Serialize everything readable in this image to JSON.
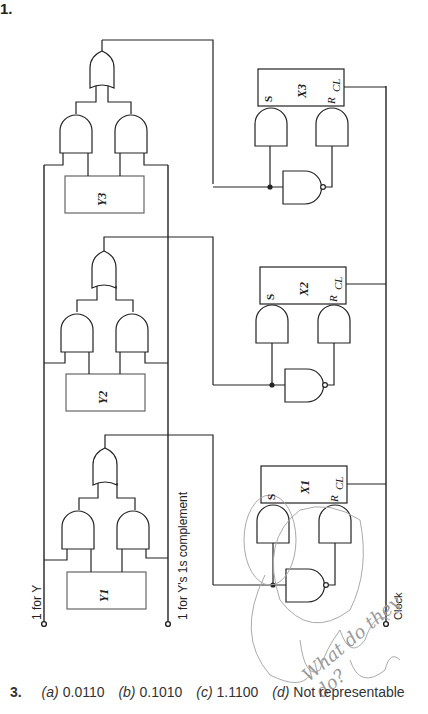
{
  "page": {
    "problem_number": "1.",
    "labels": {
      "input_y": "1 for Y",
      "input_y_complement": "1 for Y's 1s complement",
      "clock": "Clock"
    },
    "registers_y": [
      "Y3",
      "Y2",
      "Y1"
    ],
    "registers_x": [
      {
        "name": "X3",
        "pin_s": "S",
        "pin_r": "R",
        "pin_cl": "CL"
      },
      {
        "name": "X2",
        "pin_s": "S",
        "pin_r": "R",
        "pin_cl": "CL"
      },
      {
        "name": "X1",
        "pin_s": "S",
        "pin_r": "R",
        "pin_cl": "CL"
      }
    ],
    "handwritten_note": "What do they do?",
    "answer": {
      "number": "3.",
      "options": [
        {
          "letter": "(a)",
          "value": "0.0110"
        },
        {
          "letter": "(b)",
          "value": "0.1010"
        },
        {
          "letter": "(c)",
          "value": "1.1100"
        },
        {
          "letter": "(d)",
          "value": "Not representable"
        }
      ]
    }
  }
}
